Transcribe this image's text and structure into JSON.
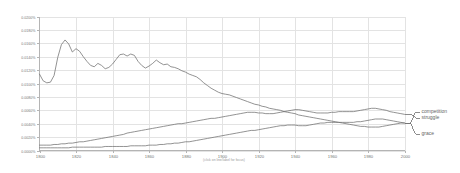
{
  "chart_data": {
    "type": "line",
    "title": "",
    "subtitle": "",
    "xlabel": "",
    "ylabel": "",
    "footnote": "(click on line/label for focus)",
    "xlim": [
      1800,
      2000
    ],
    "ylim": [
      0.0,
      0.02
    ],
    "grid": true,
    "legend_position": "right",
    "xticks": [
      1800,
      1820,
      1840,
      1860,
      1880,
      1900,
      1920,
      1940,
      1960,
      1980,
      2000
    ],
    "xticklabels": [
      "1800",
      "1820",
      "1840",
      "1860",
      "1880",
      "1900",
      "1920",
      "1940",
      "1960",
      "1980",
      "2000"
    ],
    "yticks": [
      0.0,
      0.002,
      0.004,
      0.006,
      0.008,
      0.01,
      0.012,
      0.014,
      0.016,
      0.018,
      0.02
    ],
    "yticklabels": [
      "0.0000%",
      "0.0020%",
      "0.0040%",
      "0.0060%",
      "0.0080%",
      "0.0100%",
      "0.0120%",
      "0.0140%",
      "0.0160%",
      "0.0180%",
      "0.0200%"
    ],
    "x": [
      1800,
      1802,
      1804,
      1806,
      1808,
      1810,
      1812,
      1814,
      1816,
      1818,
      1820,
      1822,
      1824,
      1826,
      1828,
      1830,
      1832,
      1834,
      1836,
      1838,
      1840,
      1842,
      1844,
      1846,
      1848,
      1850,
      1852,
      1854,
      1856,
      1858,
      1860,
      1862,
      1864,
      1866,
      1868,
      1870,
      1872,
      1874,
      1876,
      1878,
      1880,
      1882,
      1884,
      1886,
      1888,
      1890,
      1892,
      1894,
      1896,
      1898,
      1900,
      1902,
      1904,
      1906,
      1908,
      1910,
      1912,
      1914,
      1916,
      1918,
      1920,
      1922,
      1924,
      1926,
      1928,
      1930,
      1932,
      1934,
      1936,
      1938,
      1940,
      1942,
      1944,
      1946,
      1948,
      1950,
      1952,
      1954,
      1956,
      1958,
      1960,
      1962,
      1964,
      1966,
      1968,
      1970,
      1972,
      1974,
      1976,
      1978,
      1980,
      1982,
      1984,
      1986,
      1988,
      1990,
      1992,
      1994,
      1996,
      1998,
      2000
    ],
    "series": [
      {
        "name": "grace",
        "color": "#6f6f6f",
        "values": [
          0.0114,
          0.0104,
          0.0101,
          0.0102,
          0.0112,
          0.0139,
          0.0158,
          0.0165,
          0.0159,
          0.0147,
          0.0152,
          0.0148,
          0.014,
          0.0133,
          0.0127,
          0.0125,
          0.013,
          0.0127,
          0.0122,
          0.0124,
          0.0129,
          0.0136,
          0.0143,
          0.0144,
          0.0141,
          0.0144,
          0.0142,
          0.0133,
          0.0127,
          0.0123,
          0.0126,
          0.013,
          0.0135,
          0.0131,
          0.0128,
          0.0129,
          0.0125,
          0.0124,
          0.0122,
          0.0119,
          0.0117,
          0.0114,
          0.0112,
          0.011,
          0.0106,
          0.0101,
          0.0097,
          0.0093,
          0.009,
          0.0087,
          0.0085,
          0.0084,
          0.0083,
          0.0081,
          0.0079,
          0.0077,
          0.0075,
          0.0073,
          0.0071,
          0.0069,
          0.0068,
          0.0066,
          0.0065,
          0.0063,
          0.0062,
          0.0061,
          0.006,
          0.0058,
          0.0057,
          0.0056,
          0.0055,
          0.0053,
          0.0052,
          0.0051,
          0.005,
          0.0049,
          0.0048,
          0.0047,
          0.0046,
          0.0045,
          0.0044,
          0.0043,
          0.0042,
          0.0041,
          0.004,
          0.0039,
          0.0038,
          0.0037,
          0.0036,
          0.0036,
          0.0035,
          0.0035,
          0.0035,
          0.0035,
          0.0036,
          0.0037,
          0.0038,
          0.0039,
          0.004,
          0.0041,
          0.0041
        ]
      },
      {
        "name": "struggle",
        "color": "#6f6f6f",
        "values": [
          0.0008,
          0.0008,
          0.0008,
          0.0008,
          0.0009,
          0.0009,
          0.001,
          0.001,
          0.0011,
          0.0011,
          0.0012,
          0.0013,
          0.0013,
          0.0014,
          0.0015,
          0.0016,
          0.0017,
          0.0018,
          0.0019,
          0.002,
          0.0021,
          0.0022,
          0.0023,
          0.0024,
          0.0026,
          0.0027,
          0.0028,
          0.0029,
          0.003,
          0.0031,
          0.0032,
          0.0033,
          0.0034,
          0.0035,
          0.0036,
          0.0037,
          0.0038,
          0.0039,
          0.004,
          0.004,
          0.0041,
          0.0042,
          0.0043,
          0.0044,
          0.0045,
          0.0046,
          0.0047,
          0.0048,
          0.0048,
          0.0049,
          0.005,
          0.0051,
          0.0052,
          0.0053,
          0.0054,
          0.0055,
          0.0056,
          0.0057,
          0.0057,
          0.0057,
          0.0056,
          0.0056,
          0.0055,
          0.0055,
          0.0055,
          0.0056,
          0.0057,
          0.0058,
          0.0059,
          0.006,
          0.0061,
          0.0061,
          0.006,
          0.0059,
          0.0058,
          0.0057,
          0.0056,
          0.0056,
          0.0056,
          0.0056,
          0.0057,
          0.0057,
          0.0058,
          0.0058,
          0.0058,
          0.0058,
          0.0058,
          0.0059,
          0.006,
          0.0061,
          0.0062,
          0.0063,
          0.0063,
          0.0062,
          0.0061,
          0.006,
          0.0058,
          0.0057,
          0.0056,
          0.0055,
          0.0054
        ]
      },
      {
        "name": "competition",
        "color": "#6f6f6f",
        "values": [
          0.0004,
          0.0004,
          0.0004,
          0.0004,
          0.0004,
          0.0004,
          0.0004,
          0.0004,
          0.0004,
          0.0005,
          0.0005,
          0.0005,
          0.0005,
          0.0005,
          0.0005,
          0.0005,
          0.0005,
          0.0005,
          0.0006,
          0.0006,
          0.0006,
          0.0006,
          0.0006,
          0.0006,
          0.0006,
          0.0007,
          0.0007,
          0.0007,
          0.0007,
          0.0007,
          0.0008,
          0.0008,
          0.0008,
          0.0009,
          0.0009,
          0.001,
          0.001,
          0.0011,
          0.0011,
          0.0012,
          0.0013,
          0.0013,
          0.0014,
          0.0015,
          0.0016,
          0.0017,
          0.0018,
          0.0019,
          0.002,
          0.0021,
          0.0022,
          0.0023,
          0.0024,
          0.0025,
          0.0026,
          0.0027,
          0.0028,
          0.0029,
          0.003,
          0.003,
          0.0031,
          0.0032,
          0.0033,
          0.0034,
          0.0035,
          0.0036,
          0.0037,
          0.0037,
          0.0038,
          0.0038,
          0.0038,
          0.0037,
          0.0037,
          0.0037,
          0.0038,
          0.0039,
          0.004,
          0.0041,
          0.0041,
          0.0042,
          0.0042,
          0.0042,
          0.0042,
          0.0042,
          0.0042,
          0.0042,
          0.0042,
          0.0043,
          0.0043,
          0.0044,
          0.0045,
          0.0046,
          0.0047,
          0.0047,
          0.0047,
          0.0046,
          0.0045,
          0.0044,
          0.0043,
          0.0042,
          0.0041
        ]
      }
    ],
    "legend": [
      {
        "label": "competition"
      },
      {
        "label": "struggle"
      },
      {
        "label": "grace"
      }
    ]
  }
}
